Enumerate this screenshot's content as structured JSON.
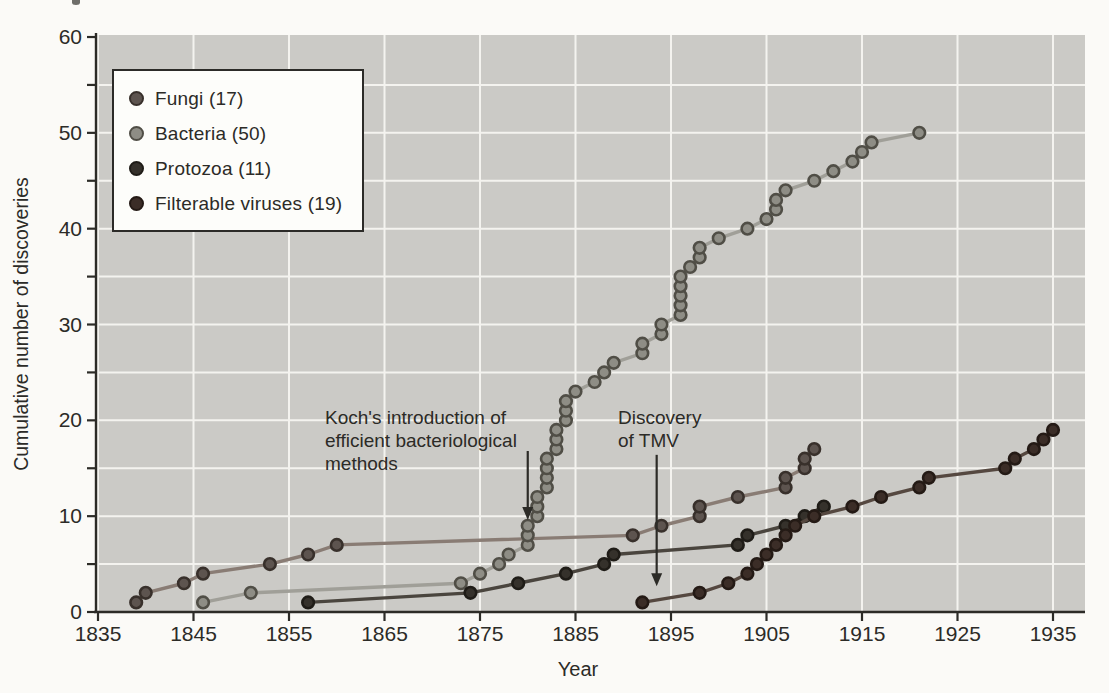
{
  "figure": {
    "page_background": "#fbfaf7",
    "plot_background": "#cbcac6",
    "grid_color": "#f4f3ef",
    "axis_color": "#2c2b27",
    "x_title": "Year",
    "y_title": "Cumulative number of discoveries"
  },
  "chart_data": {
    "type": "line",
    "title": "",
    "xlabel": "Year",
    "ylabel": "Cumulative number of discoveries",
    "xlim": [
      1835,
      1935
    ],
    "ylim": [
      0,
      60
    ],
    "x_ticks": [
      1835,
      1845,
      1855,
      1865,
      1875,
      1885,
      1895,
      1905,
      1915,
      1925,
      1935
    ],
    "y_major_ticks": [
      0,
      10,
      20,
      30,
      40,
      50,
      60
    ],
    "y_minor_step": 5,
    "grid": "on",
    "legend_position": "upper-left",
    "series": [
      {
        "name": "Fungi (17)",
        "total": 17,
        "line_color": "#897c74",
        "dot_color": "#5d544f",
        "dot_edge": "#38302b",
        "points": [
          [
            1839,
            1
          ],
          [
            1840,
            2
          ],
          [
            1844,
            3
          ],
          [
            1846,
            4
          ],
          [
            1853,
            5
          ],
          [
            1857,
            6
          ],
          [
            1860,
            7
          ],
          [
            1891,
            8
          ],
          [
            1894,
            9
          ],
          [
            1898,
            10
          ],
          [
            1898,
            11
          ],
          [
            1902,
            12
          ],
          [
            1907,
            13
          ],
          [
            1907,
            14
          ],
          [
            1909,
            15
          ],
          [
            1909,
            16
          ],
          [
            1910,
            17
          ]
        ]
      },
      {
        "name": "Bacteria (50)",
        "total": 50,
        "line_color": "#a09f98",
        "dot_color": "#8e8d85",
        "dot_edge": "#504e46",
        "points": [
          [
            1846,
            1
          ],
          [
            1851,
            2
          ],
          [
            1873,
            3
          ],
          [
            1875,
            4
          ],
          [
            1877,
            5
          ],
          [
            1878,
            6
          ],
          [
            1880,
            7
          ],
          [
            1880,
            8
          ],
          [
            1880,
            9
          ],
          [
            1881,
            10
          ],
          [
            1881,
            11
          ],
          [
            1881,
            12
          ],
          [
            1882,
            13
          ],
          [
            1882,
            14
          ],
          [
            1882,
            15
          ],
          [
            1882,
            16
          ],
          [
            1883,
            17
          ],
          [
            1883,
            18
          ],
          [
            1883,
            19
          ],
          [
            1884,
            20
          ],
          [
            1884,
            21
          ],
          [
            1884,
            22
          ],
          [
            1885,
            23
          ],
          [
            1887,
            24
          ],
          [
            1888,
            25
          ],
          [
            1889,
            26
          ],
          [
            1892,
            27
          ],
          [
            1892,
            28
          ],
          [
            1894,
            29
          ],
          [
            1894,
            30
          ],
          [
            1896,
            31
          ],
          [
            1896,
            32
          ],
          [
            1896,
            33
          ],
          [
            1896,
            34
          ],
          [
            1896,
            35
          ],
          [
            1897,
            36
          ],
          [
            1898,
            37
          ],
          [
            1898,
            38
          ],
          [
            1900,
            39
          ],
          [
            1903,
            40
          ],
          [
            1905,
            41
          ],
          [
            1906,
            42
          ],
          [
            1906,
            43
          ],
          [
            1907,
            44
          ],
          [
            1910,
            45
          ],
          [
            1912,
            46
          ],
          [
            1914,
            47
          ],
          [
            1915,
            48
          ],
          [
            1916,
            49
          ],
          [
            1921,
            50
          ]
        ]
      },
      {
        "name": "Protozoa (11)",
        "total": 11,
        "line_color": "#4a453e",
        "dot_color": "#35312b",
        "dot_edge": "#1f1c17",
        "points": [
          [
            1857,
            1
          ],
          [
            1874,
            2
          ],
          [
            1879,
            3
          ],
          [
            1884,
            4
          ],
          [
            1888,
            5
          ],
          [
            1889,
            6
          ],
          [
            1902,
            7
          ],
          [
            1903,
            8
          ],
          [
            1907,
            9
          ],
          [
            1909,
            10
          ],
          [
            1911,
            11
          ]
        ]
      },
      {
        "name": "Filterable viruses (19)",
        "total": 19,
        "line_color": "#554840",
        "dot_color": "#3b2d27",
        "dot_edge": "#241a15",
        "points": [
          [
            1892,
            1
          ],
          [
            1898,
            2
          ],
          [
            1901,
            3
          ],
          [
            1903,
            4
          ],
          [
            1904,
            5
          ],
          [
            1905,
            6
          ],
          [
            1906,
            7
          ],
          [
            1907,
            8
          ],
          [
            1908,
            9
          ],
          [
            1910,
            10
          ],
          [
            1914,
            11
          ],
          [
            1917,
            12
          ],
          [
            1921,
            13
          ],
          [
            1922,
            14
          ],
          [
            1930,
            15
          ],
          [
            1931,
            16
          ],
          [
            1933,
            17
          ],
          [
            1934,
            18
          ],
          [
            1935,
            19
          ]
        ]
      }
    ],
    "annotations": [
      {
        "text": "Koch's introduction of\nefficient bacteriological\nmethods",
        "arrow_year": 1880,
        "arrow_from_value": 16.8,
        "arrow_to_value": 9.6
      },
      {
        "text": "Discovery\nof TMV",
        "arrow_year": 1893.5,
        "arrow_from_value": 16.4,
        "arrow_to_value": 2.7
      }
    ]
  }
}
